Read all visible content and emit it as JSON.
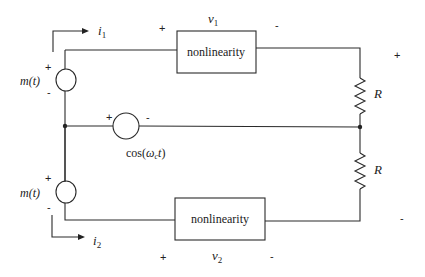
{
  "diagram": {
    "type": "circuit",
    "top_branch": {
      "current_label": "i",
      "current_sub": "1",
      "source_label": "m(t)",
      "source_plus": "+",
      "source_minus": "-",
      "nonlinearity_label": "nonlinearity",
      "voltage_label": "v",
      "voltage_sub": "1",
      "voltage_plus": "+",
      "voltage_minus": "-"
    },
    "middle_branch": {
      "source_label_prefix": "cos(",
      "source_label_omega": "ω",
      "source_label_sub": "c",
      "source_label_t": "t",
      "source_label_suffix": ")",
      "source_plus": "+",
      "source_minus": "-"
    },
    "bottom_branch": {
      "current_label": "i",
      "current_sub": "2",
      "source_label": "m(t)",
      "source_plus": "+",
      "source_minus": "-",
      "nonlinearity_label": "nonlinearity",
      "voltage_label": "v",
      "voltage_sub": "2",
      "voltage_plus": "+",
      "voltage_minus": "-"
    },
    "resistors": {
      "top_label": "R",
      "bottom_label": "R"
    },
    "output": {
      "plus": "+",
      "minus": "-"
    }
  }
}
